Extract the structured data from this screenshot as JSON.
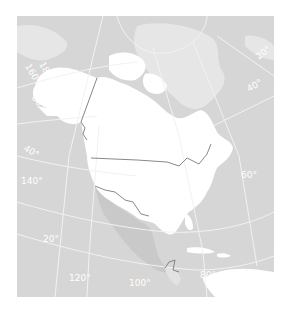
{
  "map": {
    "title": "North America",
    "colors": {
      "ocean": "#d6d6d6",
      "other_land": "#e4e4e4",
      "highlight_land": "#ffffff",
      "mexico": "#cccccc",
      "graticule": "#f2f2f2",
      "border": "#7a7a7a"
    },
    "graticule_labels": {
      "lon_160": "160°",
      "lon_180": "180°",
      "lon_140": "140°",
      "lon_120": "120°",
      "lon_100": "100°",
      "lon_80": "80°",
      "lon_60": "60°",
      "lon_40": "40°",
      "lon_20": "20°",
      "lat_60": "60°",
      "lat_40": "40°",
      "lat_20": "20°"
    }
  }
}
